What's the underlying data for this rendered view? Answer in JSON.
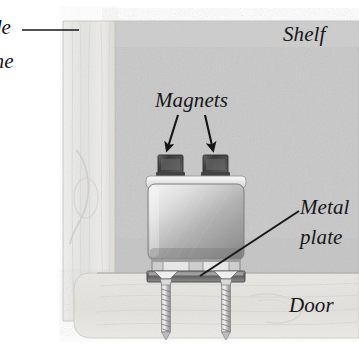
{
  "figure": {
    "kind": "technical-illustration",
    "background_color": "#ffffff"
  },
  "labels": {
    "side": "de",
    "frame": "me",
    "shelf": "Shelf",
    "magnets": "Magnets",
    "metal": "Metal",
    "plate": "plate",
    "door": "Door"
  },
  "parts": {
    "shelf_panel": "shelf-panel",
    "side_frame": "side-frame-panel",
    "door_panel": "door-panel",
    "bracket": "magnet-bracket-body",
    "magnet_left": "magnet-block-left",
    "magnet_right": "magnet-block-right",
    "metal_plate": "metal-plate-bar",
    "screw_left": "mounting-screw-left",
    "screw_right": "mounting-screw-right"
  },
  "annotations": {
    "leader_side": "leader-line-side-frame",
    "leader_metal": "leader-line-metal-plate",
    "arrow_left": "arrow-magnet-left",
    "arrow_right": "arrow-magnet-right"
  },
  "colors": {
    "shelf": "#c8c8c8",
    "side_frame": "#e9e9e7",
    "door": "#e4e3e0",
    "bracket_light": "#f0f0f0",
    "bracket_dark": "#8d8d8d",
    "magnet": "#4a4a4a",
    "plate": "#6f6f6f",
    "ink": "#17161a"
  }
}
